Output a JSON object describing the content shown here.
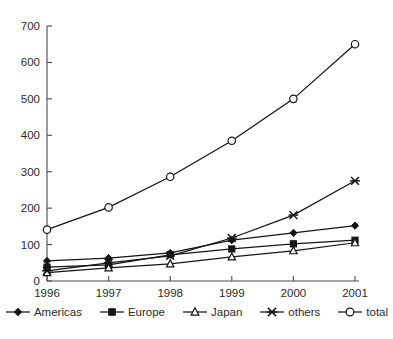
{
  "chart_data": {
    "type": "line",
    "title": "",
    "xlabel": "",
    "ylabel": "",
    "categories": [
      "1996",
      "1997",
      "1998",
      "1999",
      "2000",
      "2001"
    ],
    "x": [
      1996,
      1997,
      1998,
      1999,
      2000,
      2001
    ],
    "ylim": [
      0,
      700
    ],
    "xlim": [
      1996,
      2001
    ],
    "ytick_labels": [
      "0",
      "100",
      "200",
      "300",
      "400",
      "500",
      "600",
      "700"
    ],
    "ytick_values": [
      0,
      100,
      200,
      300,
      400,
      500,
      600,
      700
    ],
    "xtick_labels": [
      "1996",
      "1997",
      "1998",
      "1999",
      "2000",
      "2001"
    ],
    "grid": false,
    "legend_position": "bottom",
    "series": [
      {
        "name": "Americas",
        "marker": "filled-diamond",
        "values": [
          55,
          63,
          77,
          112,
          132,
          152
        ]
      },
      {
        "name": "Europe",
        "marker": "filled-square",
        "values": [
          38,
          44,
          72,
          88,
          102,
          112
        ]
      },
      {
        "name": "Japan",
        "marker": "open-triangle",
        "values": [
          23,
          36,
          47,
          66,
          83,
          105
        ]
      },
      {
        "name": "others",
        "marker": "cross-x",
        "values": [
          28,
          50,
          69,
          118,
          181,
          275
        ]
      },
      {
        "name": "total",
        "marker": "open-circle",
        "values": [
          141,
          202,
          286,
          385,
          500,
          650
        ]
      }
    ]
  },
  "legend": {
    "items": [
      {
        "label": "Americas",
        "marker": "filled-diamond"
      },
      {
        "label": "Europe",
        "marker": "filled-square"
      },
      {
        "label": "Japan",
        "marker": "open-triangle"
      },
      {
        "label": "others",
        "marker": "cross-x"
      },
      {
        "label": "total",
        "marker": "open-circle"
      }
    ]
  },
  "colors": {
    "series_stroke": "#151515",
    "axis": "#4a4a4a",
    "text": "#2b2b2b",
    "background": "#ffffff"
  }
}
